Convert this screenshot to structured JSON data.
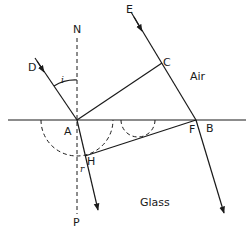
{
  "diagram": {
    "media": {
      "upper": "Air",
      "lower": "Glass"
    },
    "points": {
      "N": "N",
      "P": "P",
      "A": "A",
      "B": "B",
      "C": "C",
      "D": "D",
      "E": "E",
      "F": "F",
      "H": "H"
    },
    "angles": {
      "incidence": "i",
      "refraction": "r"
    },
    "colors": {
      "ink": "#1a1a1a",
      "background": "#ffffff"
    }
  }
}
